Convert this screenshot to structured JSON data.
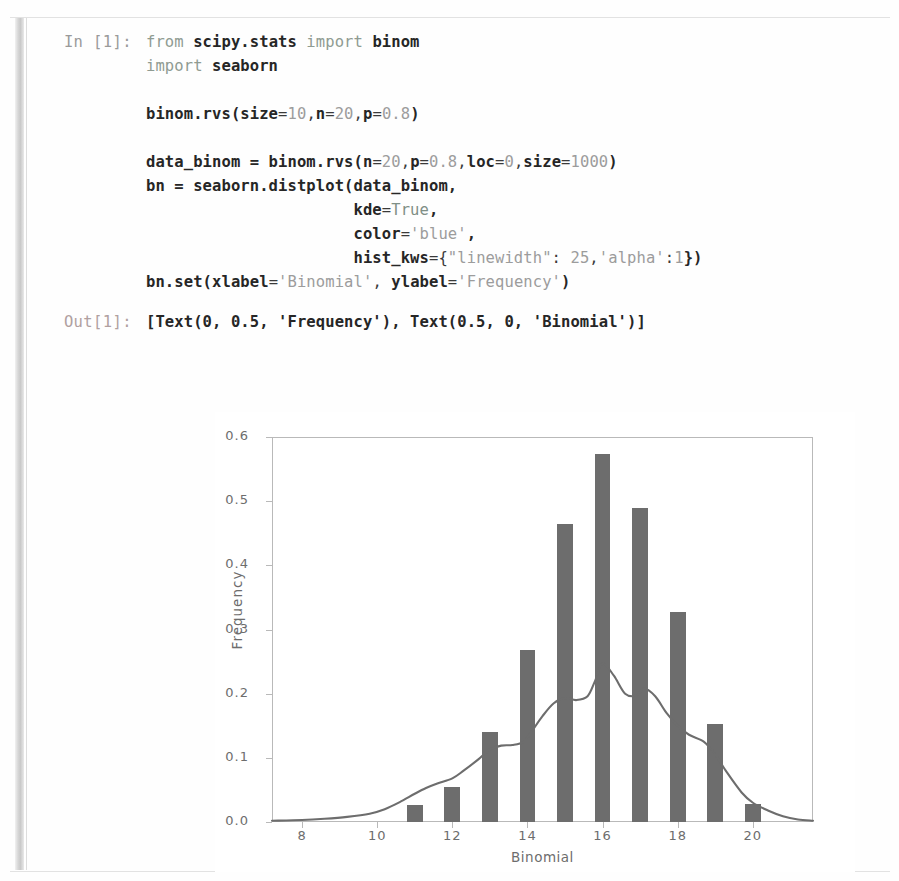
{
  "notebook": {
    "input_prompt": "In [1]:",
    "output_prompt": "Out[1]:",
    "code_lines": [
      "from scipy.stats import binom",
      "import seaborn",
      "",
      "binom.rvs(size=10,n=20,p=0.8)",
      "",
      "data_binom = binom.rvs(n=20,p=0.8,loc=0,size=1000)",
      "bn = seaborn.distplot(data_binom,",
      "                      kde=True,",
      "                      color='blue',",
      "                      hist_kws={\"linewidth\": 25,'alpha':1})",
      "bn.set(xlabel='Binomial', ylabel='Frequency')"
    ],
    "code_segments": [
      [
        [
          "kw",
          "from "
        ],
        [
          "id",
          "scipy.stats "
        ],
        [
          "kw",
          "import "
        ],
        [
          "id",
          "binom"
        ]
      ],
      [
        [
          "kw",
          "import "
        ],
        [
          "id",
          "seaborn"
        ]
      ],
      [],
      [
        [
          "id",
          "binom.rvs("
        ],
        [
          "id",
          "size"
        ],
        [
          "pun",
          "="
        ],
        [
          "num",
          "10"
        ],
        [
          "pun",
          ","
        ],
        [
          "id",
          "n"
        ],
        [
          "pun",
          "="
        ],
        [
          "num",
          "20"
        ],
        [
          "pun",
          ","
        ],
        [
          "id",
          "p"
        ],
        [
          "pun",
          "="
        ],
        [
          "num",
          "0.8"
        ],
        [
          "id",
          ")"
        ]
      ],
      [],
      [
        [
          "id",
          "data_binom = binom.rvs("
        ],
        [
          "id",
          "n"
        ],
        [
          "pun",
          "="
        ],
        [
          "num",
          "20"
        ],
        [
          "pun",
          ","
        ],
        [
          "id",
          "p"
        ],
        [
          "pun",
          "="
        ],
        [
          "num",
          "0.8"
        ],
        [
          "pun",
          ","
        ],
        [
          "id",
          "loc"
        ],
        [
          "pun",
          "="
        ],
        [
          "num",
          "0"
        ],
        [
          "pun",
          ","
        ],
        [
          "id",
          "size"
        ],
        [
          "pun",
          "="
        ],
        [
          "num",
          "1000"
        ],
        [
          "id",
          ")"
        ]
      ],
      [
        [
          "id",
          "bn = seaborn.distplot(data_binom,"
        ]
      ],
      [
        [
          "id",
          "                      kde"
        ],
        [
          "pun",
          "="
        ],
        [
          "bi",
          "True"
        ],
        [
          "id",
          ","
        ]
      ],
      [
        [
          "id",
          "                      color"
        ],
        [
          "pun",
          "="
        ],
        [
          "str",
          "'blue'"
        ],
        [
          "id",
          ","
        ]
      ],
      [
        [
          "id",
          "                      hist_kws"
        ],
        [
          "pun",
          "={"
        ],
        [
          "str",
          "\"linewidth\""
        ],
        [
          "pun",
          ": "
        ],
        [
          "num",
          "25"
        ],
        [
          "pun",
          ","
        ],
        [
          "str",
          "'alpha'"
        ],
        [
          "pun",
          ":"
        ],
        [
          "num",
          "1"
        ],
        [
          "id",
          "})"
        ]
      ],
      [
        [
          "id",
          "bn.set(xlabel"
        ],
        [
          "pun",
          "="
        ],
        [
          "str",
          "'Binomial'"
        ],
        [
          "pun",
          ", "
        ],
        [
          "id",
          "ylabel"
        ],
        [
          "pun",
          "="
        ],
        [
          "str",
          "'Frequency'"
        ],
        [
          "id",
          ")"
        ]
      ]
    ],
    "output_text": "[Text(0, 0.5, 'Frequency'), Text(0.5, 0, 'Binomial')]"
  },
  "chart_data": {
    "type": "bar",
    "title": "",
    "xlabel": "Binomial",
    "ylabel": "Frequency",
    "xlim": [
      7.2,
      21.6
    ],
    "ylim": [
      0.0,
      0.6
    ],
    "grid": false,
    "legend": null,
    "bar_color": "#6d6d6d",
    "kde_color": "#6d6d6d",
    "bar_width_units": 0.42,
    "x_ticks": [
      8,
      10,
      12,
      14,
      16,
      18,
      20
    ],
    "x_tick_labels": [
      "8",
      "10",
      "12",
      "14",
      "16",
      "18",
      "20"
    ],
    "y_ticks": [
      0.0,
      0.1,
      0.2,
      0.3,
      0.4,
      0.5,
      0.6
    ],
    "y_tick_labels": [
      "0.0",
      "0.1",
      "0.2",
      "0.3",
      "0.4",
      "0.5",
      "0.6"
    ],
    "categories": [
      11,
      12,
      13,
      14,
      15,
      16,
      17,
      18,
      19,
      20
    ],
    "values": [
      0.027,
      0.055,
      0.14,
      0.268,
      0.465,
      0.573,
      0.49,
      0.327,
      0.152,
      0.028
    ],
    "kde_curve": {
      "x": [
        7.2,
        8.0,
        8.6,
        9.2,
        9.8,
        10.2,
        10.6,
        11.0,
        11.3,
        11.6,
        12.0,
        12.3,
        12.7,
        13.0,
        13.3,
        13.6,
        13.9,
        14.1,
        14.4,
        14.7,
        15.0,
        15.3,
        15.6,
        15.8,
        16.0,
        16.3,
        16.6,
        16.9,
        17.1,
        17.4,
        17.7,
        18.0,
        18.3,
        18.7,
        19.0,
        19.3,
        19.7,
        20.0,
        20.4,
        20.8,
        21.2,
        21.6
      ],
      "y": [
        0.002,
        0.003,
        0.005,
        0.008,
        0.013,
        0.02,
        0.031,
        0.044,
        0.053,
        0.06,
        0.068,
        0.08,
        0.098,
        0.113,
        0.119,
        0.12,
        0.125,
        0.14,
        0.165,
        0.185,
        0.193,
        0.19,
        0.196,
        0.22,
        0.247,
        0.228,
        0.2,
        0.197,
        0.208,
        0.196,
        0.17,
        0.15,
        0.136,
        0.125,
        0.105,
        0.078,
        0.046,
        0.03,
        0.018,
        0.009,
        0.004,
        0.002
      ]
    }
  }
}
